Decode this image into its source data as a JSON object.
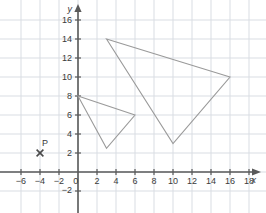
{
  "chart_data": {
    "type": "scatter",
    "title": "",
    "xlabel": "x",
    "ylabel": "y",
    "grid": true,
    "legend": "none",
    "xlim": [
      -7,
      19.5
    ],
    "ylim": [
      -3,
      17.5
    ],
    "xticks": [
      -6,
      -4,
      -2,
      0,
      2,
      4,
      6,
      8,
      10,
      12,
      14,
      16,
      18
    ],
    "yticks": [
      -2,
      0,
      2,
      4,
      6,
      8,
      10,
      12,
      14,
      16
    ],
    "xtick_labels": [
      "-6",
      "-4",
      "-2",
      "0",
      "2",
      "4",
      "6",
      "8",
      "10",
      "12",
      "14",
      "16",
      "18"
    ],
    "ytick_labels": [
      "-2",
      "0",
      "2",
      "4",
      "6",
      "8",
      "10",
      "12",
      "14",
      "16"
    ],
    "grid_step": 2,
    "shapes": [
      {
        "name": "small-triangle",
        "closed": true,
        "vertices": [
          [
            0,
            8
          ],
          [
            6,
            6
          ],
          [
            3,
            2.5
          ]
        ]
      },
      {
        "name": "large-triangle",
        "closed": true,
        "vertices": [
          [
            3,
            14
          ],
          [
            16,
            10
          ],
          [
            10,
            3
          ]
        ]
      }
    ],
    "points": [
      {
        "label": "P",
        "x": -4,
        "y": 2,
        "marker": "x"
      }
    ],
    "colors": {
      "grid": "#d9dde3",
      "axis": "#5a5a5a",
      "shape_stroke": "#9a9a9a",
      "text": "#3a3a3a",
      "background": "#ffffff"
    }
  }
}
